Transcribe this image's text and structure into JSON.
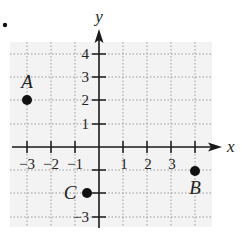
{
  "problem_marker": ".",
  "axes": {
    "x_label": "x",
    "y_label": "y",
    "x_ticks": [
      -3,
      -2,
      -1,
      1,
      2,
      3
    ],
    "x_tick_labels": [
      "−3",
      "−2",
      "−1",
      "1",
      "2",
      "3"
    ],
    "y_ticks": [
      4,
      3,
      2,
      1,
      -3
    ],
    "y_tick_labels": [
      "4",
      "3",
      "2",
      "1",
      "−3"
    ],
    "x_range": [
      -3.7,
      4.5
    ],
    "y_range": [
      -3.4,
      4.5
    ],
    "grid": true
  },
  "points": [
    {
      "label": "A",
      "x": -3,
      "y": 2
    },
    {
      "label": "B",
      "x": 4,
      "y": -1
    },
    {
      "label": "C",
      "x": -0.5,
      "y": -2
    }
  ],
  "colors": {
    "grid_bg": "#f3f3f3",
    "grid_line": "#9a9a9a",
    "axis": "#1a1a1a",
    "point": "#111111"
  }
}
